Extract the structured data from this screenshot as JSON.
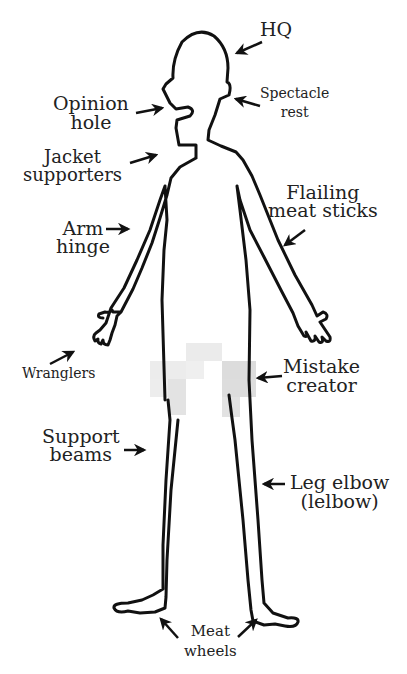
{
  "diagram": {
    "colors": {
      "ink": "#111111",
      "text": "#222222",
      "background": "#ffffff",
      "censor_light": "#ececec",
      "censor_dark": "#dcdcdc"
    },
    "labels": {
      "hq": "HQ",
      "spectacle_rest": "Spectacle\nrest",
      "opinion_hole": "Opinion\nhole",
      "jacket_supporters": "Jacket\nsupporters",
      "flailing_meat_sticks": "Flailing\nmeat sticks",
      "arm_hinge": "Arm\nhinge",
      "wranglers": "Wranglers",
      "mistake_creator": "Mistake\ncreator",
      "support_beams": "Support\nbeams",
      "leg_elbow": "Leg elbow\n(lelbow)",
      "meat_wheels": "Meat\nwheels"
    },
    "annotations": [
      {
        "id": "hq",
        "text": "HQ",
        "points_to": "head"
      },
      {
        "id": "spectacle_rest",
        "text": "Spectacle rest",
        "points_to": "ear"
      },
      {
        "id": "opinion_hole",
        "text": "Opinion hole",
        "points_to": "mouth"
      },
      {
        "id": "jacket_supporters",
        "text": "Jacket supporters",
        "points_to": "shoulders"
      },
      {
        "id": "flailing_meat_sticks",
        "text": "Flailing meat sticks",
        "points_to": "arms"
      },
      {
        "id": "arm_hinge",
        "text": "Arm hinge",
        "points_to": "elbow"
      },
      {
        "id": "wranglers",
        "text": "Wranglers",
        "points_to": "hands"
      },
      {
        "id": "mistake_creator",
        "text": "Mistake creator",
        "points_to": "groin (censored)"
      },
      {
        "id": "support_beams",
        "text": "Support beams",
        "points_to": "legs"
      },
      {
        "id": "leg_elbow",
        "text": "Leg elbow (lelbow)",
        "points_to": "knee"
      },
      {
        "id": "meat_wheels",
        "text": "Meat wheels",
        "points_to": "feet"
      }
    ]
  }
}
